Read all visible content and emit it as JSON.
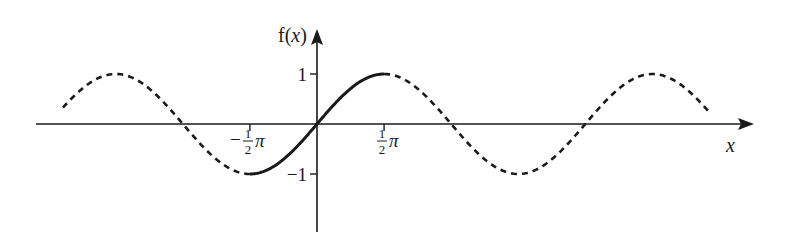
{
  "chart_data": {
    "type": "line",
    "title": "",
    "function": "sin(x)",
    "xlabel": "x",
    "ylabel": "f(x)",
    "x_range_radians": [
      -5.95,
      9.16
    ],
    "ylim": [
      -1,
      1
    ],
    "grid": false,
    "legend": "none",
    "series": [
      {
        "name": "solid segment",
        "style": "solid",
        "domain": [
          -1.5708,
          1.5708
        ]
      },
      {
        "name": "dashed left",
        "style": "dashed",
        "domain": [
          -5.95,
          -1.5708
        ]
      },
      {
        "name": "dashed right",
        "style": "dashed",
        "domain": [
          1.5708,
          9.16
        ]
      }
    ],
    "x_ticks": [
      {
        "value": -1.5708,
        "label_sign": "−",
        "label_num": "1",
        "label_den": "2",
        "label_sym": "π"
      },
      {
        "value": 1.5708,
        "label_sign": "",
        "label_num": "1",
        "label_den": "2",
        "label_sym": "π"
      }
    ],
    "y_ticks": [
      {
        "value": 1,
        "label": "1"
      },
      {
        "value": -1,
        "label": "−1"
      }
    ]
  },
  "labels": {
    "y_axis_f": "f",
    "y_axis_open": "(",
    "y_axis_x": "x",
    "y_axis_close": ")",
    "x_axis": "x"
  }
}
